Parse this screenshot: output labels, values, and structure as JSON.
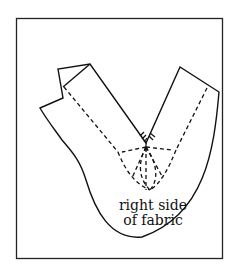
{
  "diagram": {
    "type": "sewing-pattern-illustration",
    "colors": {
      "stroke": "#111111",
      "background": "#ffffff",
      "frame": "#222222"
    },
    "annotation": {
      "line1": "right side",
      "line2": "of fabric"
    },
    "marks": {
      "clip_marks_at_v_point": "short snips at the inner corner of the V",
      "dashed_lines": "stitching guides radiating from the V point"
    }
  }
}
